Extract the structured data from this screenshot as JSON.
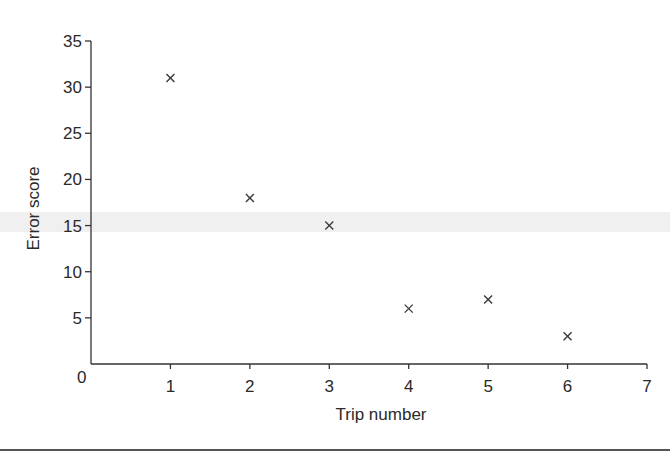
{
  "chart_data": {
    "type": "scatter",
    "title": "",
    "xlabel": "Trip number",
    "ylabel": "Error score",
    "xlim": [
      0,
      7
    ],
    "ylim": [
      0,
      35
    ],
    "xticks": [
      0,
      1,
      2,
      3,
      4,
      5,
      6,
      7
    ],
    "yticks": [
      5,
      10,
      15,
      20,
      25,
      30,
      35
    ],
    "origin_label": "0",
    "grid": false,
    "legend": null,
    "marker": "x",
    "series": [
      {
        "name": "Error score",
        "points": [
          {
            "x": 1,
            "y": 31
          },
          {
            "x": 2,
            "y": 18
          },
          {
            "x": 3,
            "y": 15
          },
          {
            "x": 4,
            "y": 6
          },
          {
            "x": 5,
            "y": 7
          },
          {
            "x": 6,
            "y": 3
          }
        ]
      }
    ]
  },
  "layout": {
    "origin_px": [
      91,
      364
    ],
    "x_end_px": 647,
    "y_top_px": 41
  },
  "colors": {
    "ink": "#2a2a2a",
    "marker": "#3a3a3a",
    "background": "#ffffff"
  }
}
